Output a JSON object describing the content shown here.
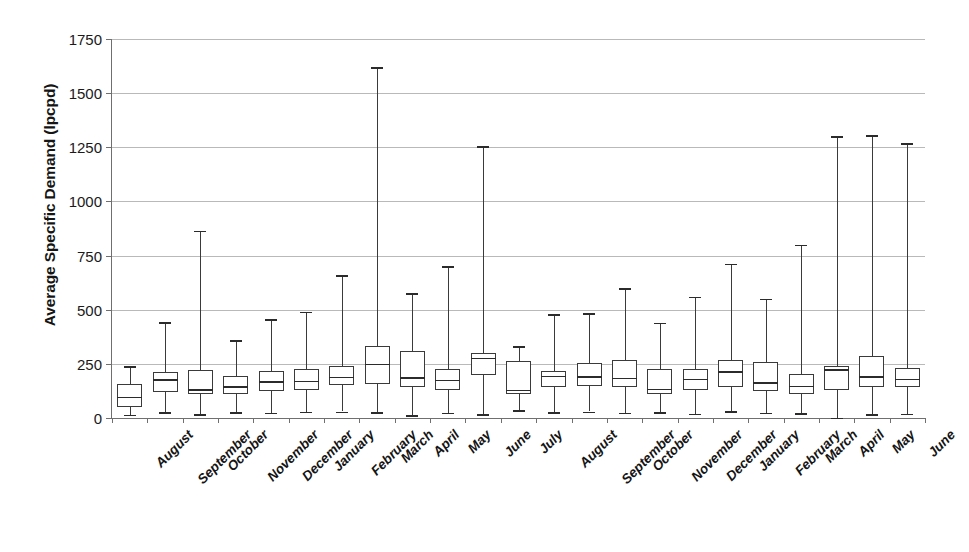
{
  "chart_data": {
    "type": "box",
    "title": "",
    "xlabel": "",
    "ylabel": "Average Specific Demand (lpcpd)",
    "ylim": [
      0,
      1750
    ],
    "ytick_labels": [
      "0",
      "250",
      "500",
      "750",
      "1000",
      "1250",
      "1500",
      "1750"
    ],
    "yticks": [
      0,
      250,
      500,
      750,
      1000,
      1250,
      1500,
      1750
    ],
    "grid": true,
    "legend": null,
    "categories": [
      "August",
      "September",
      "October",
      "November",
      "December",
      "January",
      "February",
      "March",
      "April",
      "May",
      "June",
      "July",
      "August",
      "September",
      "October",
      "November",
      "December",
      "January",
      "February",
      "March",
      "April",
      "May",
      "June"
    ],
    "boxes": [
      {
        "label": "August",
        "min": 15,
        "q1": 52,
        "median": 98,
        "q3": 157,
        "max": 240
      },
      {
        "label": "September",
        "min": 27,
        "q1": 118,
        "median": 178,
        "q3": 212,
        "max": 443
      },
      {
        "label": "October",
        "min": 18,
        "q1": 110,
        "median": 133,
        "q3": 222,
        "max": 864
      },
      {
        "label": "November",
        "min": 28,
        "q1": 113,
        "median": 146,
        "q3": 196,
        "max": 360
      },
      {
        "label": "December",
        "min": 24,
        "q1": 125,
        "median": 170,
        "q3": 218,
        "max": 455
      },
      {
        "label": "January",
        "min": 30,
        "q1": 130,
        "median": 172,
        "q3": 228,
        "max": 490
      },
      {
        "label": "February",
        "min": 30,
        "q1": 152,
        "median": 190,
        "q3": 240,
        "max": 660
      },
      {
        "label": "March",
        "min": 27,
        "q1": 157,
        "median": 249,
        "q3": 332,
        "max": 1620
      },
      {
        "label": "April",
        "min": 12,
        "q1": 142,
        "median": 188,
        "q3": 310,
        "max": 575
      },
      {
        "label": "May",
        "min": 25,
        "q1": 130,
        "median": 175,
        "q3": 228,
        "max": 700
      },
      {
        "label": "June",
        "min": 18,
        "q1": 200,
        "median": 278,
        "q3": 298,
        "max": 1255
      },
      {
        "label": "July",
        "min": 35,
        "q1": 110,
        "median": 130,
        "q3": 265,
        "max": 332
      },
      {
        "label": "August",
        "min": 28,
        "q1": 145,
        "median": 195,
        "q3": 218,
        "max": 480
      },
      {
        "label": "September",
        "min": 30,
        "q1": 146,
        "median": 192,
        "q3": 255,
        "max": 485
      },
      {
        "label": "October",
        "min": 25,
        "q1": 145,
        "median": 185,
        "q3": 270,
        "max": 600
      },
      {
        "label": "November",
        "min": 27,
        "q1": 110,
        "median": 135,
        "q3": 228,
        "max": 440
      },
      {
        "label": "December",
        "min": 20,
        "q1": 130,
        "median": 180,
        "q3": 225,
        "max": 560
      },
      {
        "label": "January",
        "min": 32,
        "q1": 145,
        "median": 215,
        "q3": 268,
        "max": 712
      },
      {
        "label": "February",
        "min": 25,
        "q1": 125,
        "median": 165,
        "q3": 260,
        "max": 550
      },
      {
        "label": "March",
        "min": 22,
        "q1": 110,
        "median": 148,
        "q3": 205,
        "max": 800
      },
      {
        "label": "April",
        "min": 2,
        "q1": 128,
        "median": 225,
        "q3": 242,
        "max": 1300
      },
      {
        "label": "May",
        "min": 18,
        "q1": 145,
        "median": 192,
        "q3": 288,
        "max": 1305
      },
      {
        "label": "June",
        "min": 20,
        "q1": 145,
        "median": 180,
        "q3": 232,
        "max": 1270
      }
    ]
  }
}
